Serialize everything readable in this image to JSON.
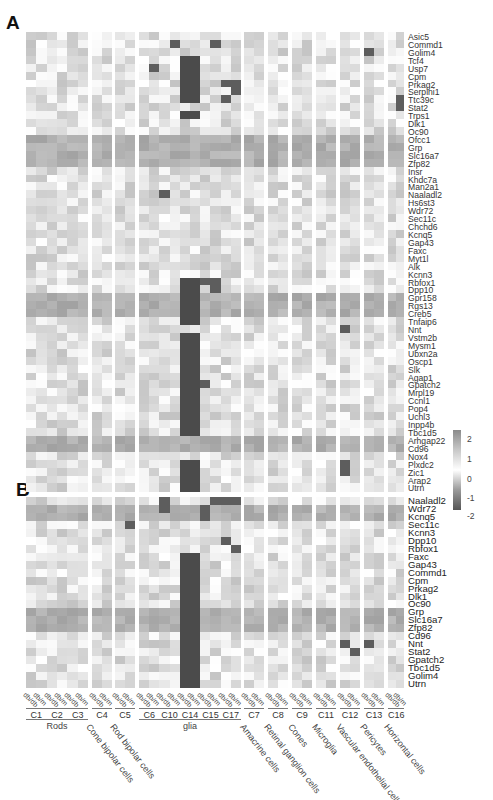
{
  "figure": {
    "panel_a_label": "A",
    "panel_b_label": "B",
    "caption_fragment": ""
  },
  "legend": {
    "type": "colorbar",
    "ticks": [
      "2",
      "1",
      "0",
      "-1",
      "-2"
    ],
    "colors": {
      "high": "#8a8a8a",
      "mid": "#ffffff",
      "low": "#555555"
    }
  },
  "columns": {
    "conditions": [
      "db/db",
      "db/m"
    ],
    "clusters": [
      "C1",
      "C2",
      "C3",
      "C4",
      "C5",
      "C6",
      "C10",
      "C14",
      "C15",
      "C17",
      "C7",
      "C8",
      "C9",
      "C11",
      "C12",
      "C13",
      "C16"
    ],
    "groups": [
      {
        "label": "Rods",
        "clusters": [
          "C1",
          "C2",
          "C3"
        ],
        "rotated": false
      },
      {
        "label": "Cone bipolar cells",
        "clusters": [
          "C4"
        ],
        "rotated": true
      },
      {
        "label": "Rod bipolar cells",
        "clusters": [
          "C5"
        ],
        "rotated": true
      },
      {
        "label": "Müller glia",
        "display": "glia",
        "clusters": [
          "C6",
          "C10",
          "C14",
          "C15",
          "C17"
        ],
        "rotated": false
      },
      {
        "label": "Amacrine cells",
        "clusters": [
          "C7"
        ],
        "rotated": true
      },
      {
        "label": "Retinal ganglion cells",
        "clusters": [
          "C8"
        ],
        "rotated": true
      },
      {
        "label": "Cones",
        "clusters": [
          "C9"
        ],
        "rotated": true
      },
      {
        "label": "Microglia",
        "clusters": [
          "C11"
        ],
        "rotated": true
      },
      {
        "label": "Vascular endothelial cells",
        "clusters": [
          "C12"
        ],
        "rotated": true
      },
      {
        "label": "Pericytes",
        "clusters": [
          "C13"
        ],
        "rotated": true
      },
      {
        "label": "Horizontal cells",
        "clusters": [
          "C16"
        ],
        "rotated": true
      }
    ]
  },
  "panel_a": {
    "genes": [
      "Asic5",
      "Commd1",
      "Golim4",
      "Tcf4",
      "Usp7",
      "Cpm",
      "Prkag2",
      "Serpini1",
      "Ttc39c",
      "Stat2",
      "Trps1",
      "Dlk1",
      "Oc90",
      "Ofcc1",
      "Grp",
      "Slc16a7",
      "Zfp82",
      "Insr",
      "Khdc7a",
      "Man2a1",
      "Naaladl2",
      "Hs6st3",
      "Wdr72",
      "Sec11c",
      "Chchd6",
      "Kcnq5",
      "Gap43",
      "Faxc",
      "Myt1l",
      "Alk",
      "Kcnn3",
      "Rbfox1",
      "Dpp10",
      "Gpr158",
      "Rgs13",
      "Creb5",
      "Tnfaip6",
      "Nnt",
      "Vstm2b",
      "Mysm1",
      "Ubxn2a",
      "Oscp1",
      "Slk",
      "Agap1",
      "Gpatch2",
      "Mrpl19",
      "Ccnl1",
      "Pop4",
      "Uchl3",
      "Inpp4b",
      "Tbc1d5",
      "Arhgap22",
      "Cd96",
      "Nox4",
      "Plxdc2",
      "Zic1",
      "Arap2",
      "Utrn"
    ]
  },
  "panel_b": {
    "genes": [
      "Naaladl2",
      "Wdr72",
      "Kcnq5",
      "Sec11c",
      "Kcnn3",
      "Dpp10",
      "Rbfox1",
      "Faxc",
      "Gap43",
      "Commd1",
      "Cpm",
      "Prkag2",
      "Dlk1",
      "Oc90",
      "Grp",
      "Slc16a7",
      "Zfp82",
      "Cd96",
      "Nnt",
      "Stat2",
      "Gpatch2",
      "Tbc1d5",
      "Golim4",
      "Utrn"
    ]
  },
  "chart_data": [
    {
      "type": "heatmap",
      "title": "A",
      "xlabel": "",
      "ylabel": "",
      "color_scale": {
        "min": -2,
        "max": 2,
        "ticks": [
          2,
          1,
          0,
          -1,
          -2
        ]
      },
      "rows": "panel_a.genes",
      "columns_note": "32 columns: db/db and db/m for each of 16 clusters C1,C2,C3,C4,C5,C6,C10,C14,C15,C17,C7,C8,C9,C11,C12,C13,C16",
      "notes": "C14 (glia) columns strongly low (dark, ≈ -2) for Tcf4–Ttc39c, Trps1, Dpp10–Tnfaip6 and Vstm2b–Inpp4b; rows Grp/Slc16a7/Zfp82, Gpr158–Creb5 and Arhgap22/Cd96 uniformly mid-gray (≈1–1.5) across clusters"
    },
    {
      "type": "heatmap",
      "title": "B",
      "color_scale": {
        "min": -2,
        "max": 2
      },
      "rows": "panel_b.genes",
      "notes": "Same column layout; C14 low for Faxc through Golim4; Naaladl2/Wdr72/Kcnq5 elevated in C11–C16"
    }
  ]
}
